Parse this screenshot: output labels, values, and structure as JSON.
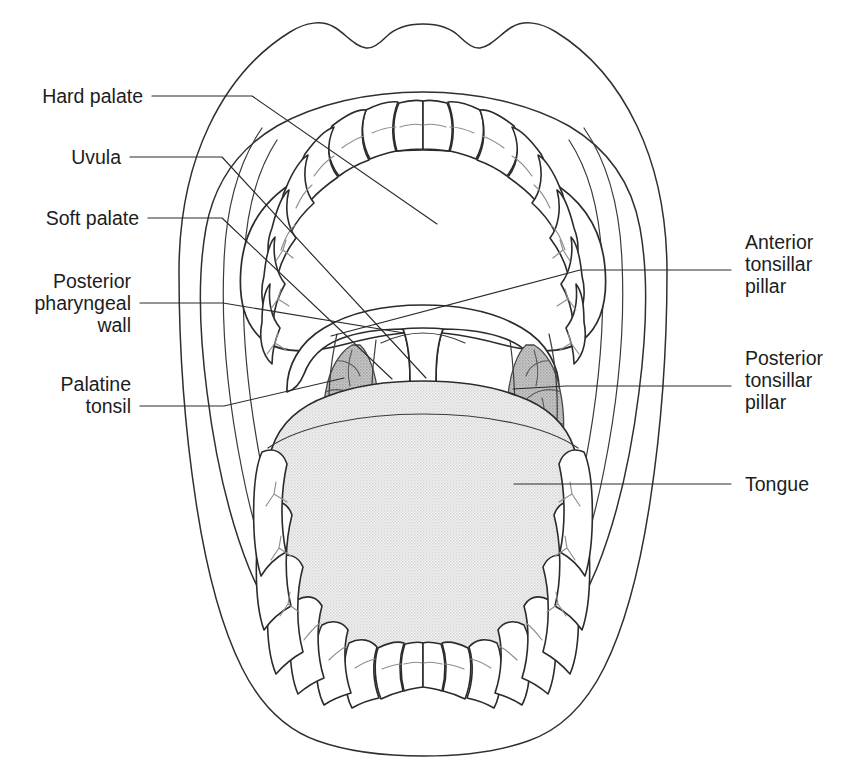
{
  "figure": {
    "type": "anatomical-line-diagram"
  },
  "labels": {
    "left": [
      {
        "id": "hard-palate",
        "text": "Hard palate",
        "lines": [
          "Hard palate"
        ],
        "align": "right"
      },
      {
        "id": "uvula",
        "text": "Uvula",
        "lines": [
          "Uvula"
        ],
        "align": "right"
      },
      {
        "id": "soft-palate",
        "text": "Soft palate",
        "lines": [
          "Soft palate"
        ],
        "align": "right"
      },
      {
        "id": "posterior-pharyngeal-wall",
        "text": "Posterior pharyngeal wall",
        "lines": [
          "Posterior",
          "pharyngeal",
          "wall"
        ],
        "align": "right"
      },
      {
        "id": "palatine-tonsil",
        "text": "Palatine tonsil",
        "lines": [
          "Palatine",
          "tonsil"
        ],
        "align": "right"
      }
    ],
    "right": [
      {
        "id": "anterior-tonsillar-pillar",
        "text": "Anterior tonsillar pillar",
        "lines": [
          "Anterior",
          "tonsillar",
          "pillar"
        ],
        "align": "left"
      },
      {
        "id": "posterior-tonsillar-pillar",
        "text": "Posterior tonsillar pillar",
        "lines": [
          "Posterior",
          "tonsillar",
          "pillar"
        ],
        "align": "left"
      },
      {
        "id": "tongue",
        "text": "Tongue",
        "lines": [
          "Tongue"
        ],
        "align": "left"
      }
    ]
  },
  "label_text": {
    "hard_palate": "Hard palate",
    "uvula": "Uvula",
    "soft_palate": "Soft palate",
    "posterior_pharyngeal_wall_1": "Posterior",
    "posterior_pharyngeal_wall_2": "pharyngeal",
    "posterior_pharyngeal_wall_3": "wall",
    "palatine_tonsil_1": "Palatine",
    "palatine_tonsil_2": "tonsil",
    "anterior_tonsillar_pillar_1": "Anterior",
    "anterior_tonsillar_pillar_2": "tonsillar",
    "anterior_tonsillar_pillar_3": "pillar",
    "posterior_tonsillar_pillar_1": "Posterior",
    "posterior_tonsillar_pillar_2": "tonsillar",
    "posterior_tonsillar_pillar_3": "pillar",
    "tongue": "Tongue"
  },
  "colors": {
    "background": "#ffffff",
    "line": "#2b2b2b",
    "leader": "#2a2a2a",
    "text": "#1d1d1d",
    "tooth": "#ffffff",
    "tooth_detail": "#8d8d8d",
    "tongue": "#e6e6e6",
    "palate": "#ffffff",
    "tonsil": "#b9b9b9"
  },
  "structures": [
    {
      "id": "lips-outer",
      "name": "lips outer contour"
    },
    {
      "id": "lips-inner",
      "name": "lips inner contour"
    },
    {
      "id": "upper-teeth",
      "name": "upper dental arch",
      "count": 16
    },
    {
      "id": "lower-teeth",
      "name": "lower dental arch",
      "count": 16
    },
    {
      "id": "hard-palate",
      "name": "hard palate"
    },
    {
      "id": "soft-palate",
      "name": "soft palate"
    },
    {
      "id": "uvula",
      "name": "uvula"
    },
    {
      "id": "anterior-tonsillar-pillar",
      "name": "anterior tonsillar pillar (palatoglossal arch)"
    },
    {
      "id": "posterior-tonsillar-pillar",
      "name": "posterior tonsillar pillar (palatopharyngeal arch)"
    },
    {
      "id": "palatine-tonsil-left",
      "name": "palatine tonsil (left)"
    },
    {
      "id": "palatine-tonsil-right",
      "name": "palatine tonsil (right)"
    },
    {
      "id": "posterior-pharyngeal-wall",
      "name": "posterior pharyngeal wall"
    },
    {
      "id": "tongue",
      "name": "tongue"
    }
  ]
}
